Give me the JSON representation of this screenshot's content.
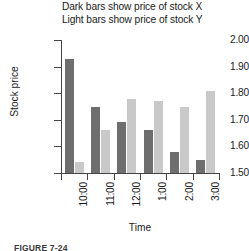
{
  "figure": {
    "title_lines": [
      "Dark bars show price of stock X",
      "Light bars show price of stock Y"
    ],
    "caption": "FIGURE 7-24"
  },
  "colors": {
    "dark_bar": "#6e6e6e",
    "light_bar": "#c9c9c9",
    "axis": "#444444",
    "text": "#1a1a1a",
    "background": "#ffffff"
  },
  "axes": {
    "y_title": "Stock price",
    "x_title": "Time",
    "y_ticks": [
      "2.00",
      "1.90",
      "1.80",
      "1.70",
      "1.60",
      "1.50"
    ],
    "x_ticks": [
      "10:00",
      "11:00",
      "12:00",
      "1:00",
      "2:00",
      "3:00"
    ]
  },
  "chart_data": {
    "type": "bar",
    "xlabel": "Time",
    "ylabel": "Stock price",
    "ylim": [
      1.5,
      2.0
    ],
    "ytick_step": 0.1,
    "grid": false,
    "legend_position": "title",
    "categories": [
      "10:00",
      "11:00",
      "12:00",
      "1:00",
      "2:00",
      "3:00"
    ],
    "series": [
      {
        "name": "stock X",
        "style": "dark bars",
        "color": "#6e6e6e",
        "values": [
          1.93,
          1.75,
          1.69,
          1.66,
          1.58,
          1.55
        ]
      },
      {
        "name": "stock Y",
        "style": "light bars",
        "color": "#c9c9c9",
        "values": [
          1.54,
          1.66,
          1.78,
          1.77,
          1.75,
          1.81
        ]
      }
    ]
  }
}
